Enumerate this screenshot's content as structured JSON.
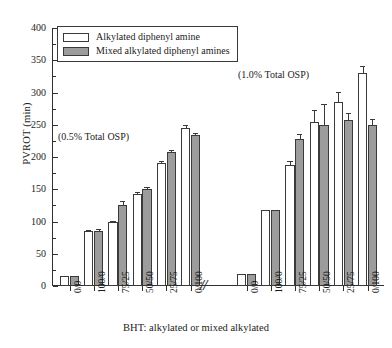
{
  "chart_data": {
    "type": "bar",
    "title": "",
    "subtitle": "",
    "xlabel": "BHT: alkylated or mixed alkylated",
    "ylabel": "PVROT (min)",
    "ylim": [
      0,
      400
    ],
    "ytick_step": 50,
    "ytick_labels": [
      "0",
      "50",
      "100",
      "150",
      "200",
      "250",
      "300",
      "350",
      "400"
    ],
    "ytick_values": [
      0,
      50,
      100,
      150,
      200,
      250,
      300,
      350,
      400
    ],
    "yminor_step": 25,
    "grid": false,
    "legend_position": "top-left",
    "axis_break": "//",
    "categories": [
      "0/0",
      "100/0",
      "75/25",
      "50/50",
      "25/75",
      "0/100"
    ],
    "legend": [
      {
        "name": "Alkylated diphenyl amine",
        "color": "#ffffff"
      },
      {
        "name": "Mixed alkylated diphenyl amines",
        "color": "#9c9c9c"
      }
    ],
    "groups": [
      {
        "annotation": "(0.5% Total OSP)",
        "categories": [
          "0/0",
          "100/0",
          "75/25",
          "50/50",
          "25/75",
          "0/100"
        ],
        "series": [
          {
            "name": "Alkylated diphenyl amine",
            "color": "#ffffff",
            "values": [
              16,
              85,
              99,
              143,
              191,
              245
            ],
            "errors": [
              0,
              1,
              1,
              1,
              2,
              3
            ]
          },
          {
            "name": "Mixed alkylated diphenyl amines",
            "color": "#9c9c9c",
            "values": [
              16,
              86,
              126,
              151,
              208,
              234
            ],
            "errors": [
              0,
              1,
              5,
              1,
              2,
              2
            ]
          }
        ]
      },
      {
        "annotation": "(1.0% Total OSP)",
        "categories": [
          "0/0",
          "100/0",
          "75/25",
          "50/50",
          "25/75",
          "0/100"
        ],
        "series": [
          {
            "name": "Alkylated diphenyl amine",
            "color": "#ffffff",
            "values": [
              18,
              118,
              188,
              255,
              286,
              331
            ],
            "errors": [
              0,
              0,
              4,
              17,
              13,
              8
            ]
          },
          {
            "name": "Mixed alkylated diphenyl amines",
            "color": "#9c9c9c",
            "values": [
              19,
              118,
              228,
              249,
              258,
              250
            ],
            "errors": [
              0,
              0,
              6,
              31,
              8,
              8
            ]
          }
        ]
      }
    ]
  },
  "axis": {
    "y_title": "PVROT (min)",
    "x_title": "BHT: alkylated or mixed alkylated",
    "break_symbol": "//"
  }
}
